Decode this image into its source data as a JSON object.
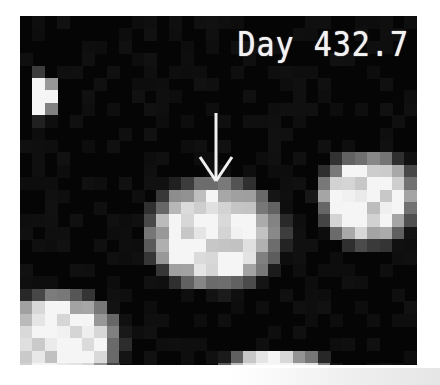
{
  "image": {
    "label": "Day 432.7",
    "marker": "arrow-down-icon",
    "background": "#050505",
    "pixel_size": 12.4,
    "blobs": [
      {
        "name": "central-source",
        "cx": 195,
        "cy": 218,
        "rx": 62,
        "ry": 50,
        "core": "#f4f4f4"
      },
      {
        "name": "right-source",
        "cx": 348,
        "cy": 183,
        "rx": 46,
        "ry": 42,
        "core": "#f0f0f0"
      },
      {
        "name": "bottom-left-source",
        "cx": 40,
        "cy": 325,
        "rx": 55,
        "ry": 45,
        "core": "#d8d8d8"
      },
      {
        "name": "bottom-center-source",
        "cx": 255,
        "cy": 352,
        "rx": 50,
        "ry": 16,
        "core": "#e8e8e8"
      },
      {
        "name": "top-left-source",
        "cx": 22,
        "cy": 80,
        "rx": 12,
        "ry": 22,
        "core": "#e0e0e0"
      }
    ]
  }
}
